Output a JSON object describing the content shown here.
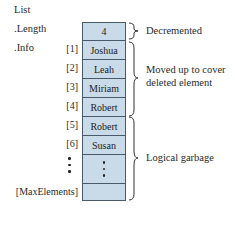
{
  "labels": {
    "list": "List",
    "length": ".Length",
    "info": ".Info"
  },
  "array": {
    "length_value": "4",
    "cells": [
      {
        "index": "[1]",
        "value": "Joshua"
      },
      {
        "index": "[2]",
        "value": "Leah"
      },
      {
        "index": "[3]",
        "value": "Miriam"
      },
      {
        "index": "[4]",
        "value": "Robert"
      },
      {
        "index": "[5]",
        "value": "Robert"
      },
      {
        "index": "[6]",
        "value": "Susan"
      }
    ],
    "max_index": "[MaxElements]",
    "max_value": ""
  },
  "annotations": {
    "decremented": "Decremented",
    "moved_line1": "Moved up to cover",
    "moved_line2": "deleted element",
    "garbage": "Logical garbage"
  },
  "colors": {
    "cell_fill": "#c9dbe8",
    "cell_border": "#4a5a6a",
    "text": "#2a2a2a"
  }
}
